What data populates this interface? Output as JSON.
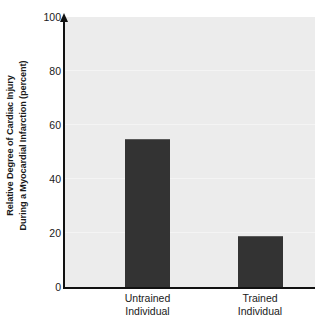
{
  "chart_data": {
    "type": "bar",
    "title": "",
    "subtitle": "",
    "xlabel": "",
    "ylabel": "Relative Degree of Cardiac Injury During a Myocardial Infarction (percent)",
    "ylabel_lines": [
      "Relative Degree of Cardiac Injury",
      "During a Myocardial Infarction (percent)"
    ],
    "categories": [
      "Untrained Individual",
      "Trained Individual"
    ],
    "category_lines": [
      [
        "Untrained",
        "Individual"
      ],
      [
        "Trained",
        "Individual"
      ]
    ],
    "values": [
      55,
      19
    ],
    "ylim": [
      0,
      100
    ],
    "yticks": [
      0,
      20,
      40,
      60,
      80,
      100
    ],
    "ytick_labels": [
      "0",
      "20",
      "40",
      "60",
      "80",
      "100"
    ],
    "grid": true,
    "grid_axis": "y",
    "legend": false,
    "legend_position": "none",
    "bar_color": "#333333",
    "plot_background": "#ececec",
    "figure_background": "#ffffff",
    "axis_color": "#111111",
    "gridline_color": "#f4f4f4"
  }
}
